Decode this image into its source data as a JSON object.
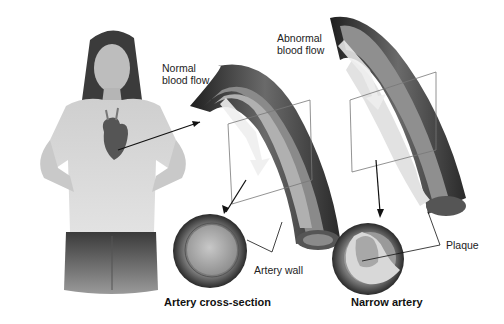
{
  "figure": {
    "type": "medical-illustration",
    "palette": {
      "background": "#ffffff",
      "artery_dark": "#2e2e2e",
      "artery_mid": "#6e6e6e",
      "lumen": "#bdbdbd",
      "plaque": "#e6e6e6",
      "line": "#111111"
    }
  },
  "labels": {
    "normal_flow": "Normal\nblood flow",
    "normal_flow_line1": "Normal",
    "normal_flow_line2": "blood flow",
    "abnormal_flow_line1": "Abnormal",
    "abnormal_flow_line2": "blood flow",
    "artery_wall": "Artery wall",
    "plaque": "Plaque"
  },
  "captions": {
    "left": "Artery cross-section",
    "right": "Narrow artery"
  }
}
